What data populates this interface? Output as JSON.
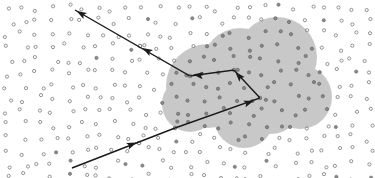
{
  "diagram": {
    "type": "random-walk-scattering",
    "colors": {
      "background": "#ffffff",
      "cloud": "#c8c8c8",
      "particle_outline": "#7a7a7a",
      "particle_inside": "#6a6a6a",
      "path": "#1a1a1a"
    },
    "cloud_lobes": [
      {
        "cx": 277,
        "cy": 57,
        "r": 40
      },
      {
        "cx": 208,
        "cy": 86,
        "r": 42
      },
      {
        "cx": 240,
        "cy": 66,
        "r": 38
      },
      {
        "cx": 300,
        "cy": 97,
        "r": 32
      },
      {
        "cx": 244,
        "cy": 118,
        "r": 30
      },
      {
        "cx": 270,
        "cy": 100,
        "r": 34
      },
      {
        "cx": 190,
        "cy": 104,
        "r": 28
      }
    ],
    "path_points": [
      {
        "x": 72,
        "y": 168
      },
      {
        "x": 175,
        "y": 128
      },
      {
        "x": 260,
        "y": 98
      },
      {
        "x": 234,
        "y": 70
      },
      {
        "x": 190,
        "y": 76
      },
      {
        "x": 75,
        "y": 10
      }
    ],
    "arrowheads": [
      {
        "x": 133,
        "y": 144,
        "angle": -21
      },
      {
        "x": 250,
        "y": 102,
        "angle": -20
      },
      {
        "x": 238,
        "y": 75,
        "angle": -132
      },
      {
        "x": 197,
        "y": 75,
        "angle": 188
      },
      {
        "x": 146,
        "y": 50,
        "angle": 210
      },
      {
        "x": 80,
        "y": 13,
        "angle": 210
      }
    ],
    "scatter_nodes": [
      {
        "x": 139,
        "y": 143
      },
      {
        "x": 175,
        "y": 128
      },
      {
        "x": 260,
        "y": 98
      },
      {
        "x": 234,
        "y": 70
      },
      {
        "x": 190,
        "y": 76
      },
      {
        "x": 140,
        "y": 46
      }
    ]
  }
}
